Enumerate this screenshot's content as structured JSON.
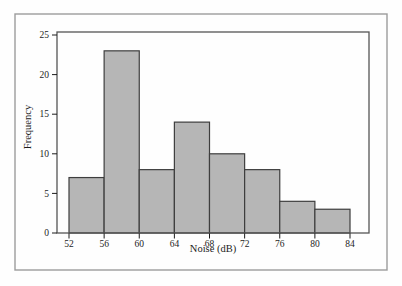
{
  "chart_data": {
    "type": "bar",
    "subtype": "histogram",
    "xlabel": "Noise (dB)",
    "ylabel": "Frequency",
    "bin_edges": [
      52,
      56,
      60,
      64,
      68,
      72,
      76,
      80,
      84
    ],
    "values": [
      7,
      23,
      8,
      14,
      10,
      8,
      4,
      3
    ],
    "x_tick_labels": [
      "52",
      "56",
      "60",
      "64",
      "68",
      "72",
      "76",
      "80",
      "84"
    ],
    "y_ticks": [
      0,
      5,
      10,
      15,
      20,
      25
    ],
    "xlim": [
      50.6,
      86.2
    ],
    "ylim": [
      0,
      25.4
    ],
    "grid": false,
    "colors": {
      "bar_fill": "#b6b6b6",
      "bar_stroke": "#3e3e3e",
      "axis": "#1c1c1c",
      "plot_border": "#555555",
      "outer_border": "#9c9c9c",
      "background": "#fefefe"
    }
  }
}
